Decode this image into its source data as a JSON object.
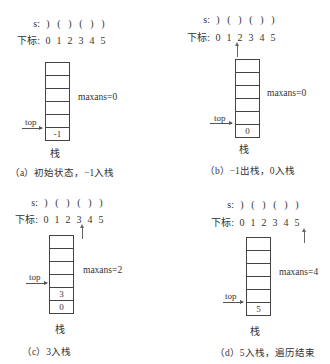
{
  "common": {
    "s_label": "s:",
    "index_label": "下标:",
    "string_chars": [
      ")",
      "(",
      ")",
      "(",
      ")",
      ")"
    ],
    "indices": [
      "0",
      "1",
      "2",
      "3",
      "4",
      "5"
    ],
    "top_label": "top",
    "stack_label": "栈"
  },
  "panels": [
    {
      "id": "a",
      "pointer_index": null,
      "stack_bottom_up": [
        "-1"
      ],
      "maxans": "maxans=0",
      "caption": "（a）初始状态，−1入栈"
    },
    {
      "id": "b",
      "pointer_index": 0,
      "stack_bottom_up": [
        "0"
      ],
      "maxans": "maxans=0",
      "caption": "（b）−1出栈，0入栈"
    },
    {
      "id": "c",
      "pointer_index": 3,
      "stack_bottom_up": [
        "0",
        "3"
      ],
      "maxans": "maxans=2",
      "caption": "（c）3入栈"
    },
    {
      "id": "d",
      "pointer_index": 5,
      "stack_bottom_up": [
        "5"
      ],
      "maxans": "maxans=4",
      "caption": "（d）5入栈，遍历结束"
    }
  ]
}
